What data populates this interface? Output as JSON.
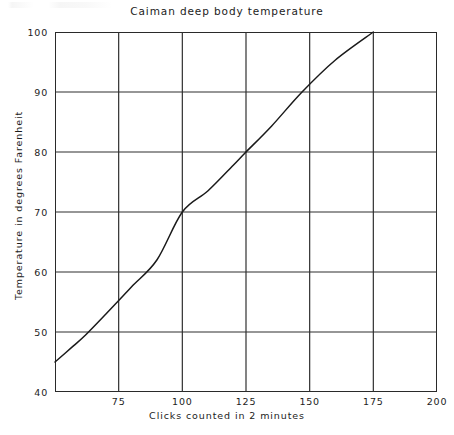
{
  "chart_data": {
    "type": "line",
    "title": "Caiman deep body temperature",
    "xlabel": "Clicks counted in 2 minutes",
    "ylabel": "Temperature in degrees Farenheit",
    "xlim": [
      50,
      200
    ],
    "ylim": [
      40,
      100
    ],
    "xticks": [
      50,
      75,
      100,
      125,
      150,
      175,
      200
    ],
    "xtick_labels": [
      "",
      "75",
      "100",
      "125",
      "150",
      "175",
      "200"
    ],
    "yticks": [
      40,
      50,
      60,
      70,
      80,
      90,
      100
    ],
    "ytick_labels": [
      "40",
      "50",
      "60",
      "70",
      "80",
      "90",
      "100"
    ],
    "grid": true,
    "legend": "none",
    "series": [
      {
        "name": "Caiman deep body temperature",
        "x": [
          50,
          57,
          62,
          70,
          80,
          90,
          100,
          110,
          120,
          125,
          135,
          147,
          160,
          175
        ],
        "y": [
          45.0,
          47.6,
          49.5,
          53.0,
          57.5,
          62.0,
          70.0,
          73.5,
          77.8,
          80.0,
          84.3,
          90.0,
          95.3,
          100.0
        ]
      }
    ],
    "annotations": []
  },
  "figure": {
    "title": "Caiman deep body temperature",
    "xaxis_title": "Clicks counted in 2 minutes",
    "yaxis_title": "Temperature in degrees Farenheit"
  },
  "colors": {
    "ink": "#1c1c1c",
    "axis": "#2a2a2a",
    "grid": "#2f2f2f",
    "curve": "#1a1a1a",
    "background": "#ffffff"
  }
}
